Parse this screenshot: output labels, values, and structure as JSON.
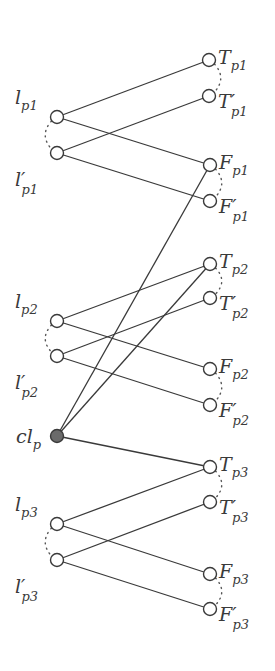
{
  "diagram": {
    "title": "",
    "node_radius": 6.5,
    "colors": {
      "line": "#3a3a3a",
      "node_fill": "#ffffff",
      "filled_node": "#6a6a6a"
    },
    "nodes": [
      {
        "id": "T_p1",
        "main": "T",
        "prime": false,
        "sub": "p1",
        "x": 209,
        "y": 60,
        "side": "right"
      },
      {
        "id": "T'_p1",
        "main": "T",
        "prime": true,
        "sub": "p1",
        "x": 209,
        "y": 96,
        "side": "right"
      },
      {
        "id": "l_p1",
        "main": "l",
        "prime": false,
        "sub": "p1",
        "x": 57,
        "y": 117,
        "side": "left"
      },
      {
        "id": "l'_p1",
        "main": "l",
        "prime": true,
        "sub": "p1",
        "x": 57,
        "y": 153,
        "side": "left"
      },
      {
        "id": "F_p1",
        "main": "F",
        "prime": false,
        "sub": "p1",
        "x": 210,
        "y": 165,
        "side": "right"
      },
      {
        "id": "F'_p1",
        "main": "F",
        "prime": true,
        "sub": "p1",
        "x": 210,
        "y": 201,
        "side": "right"
      },
      {
        "id": "T_p2",
        "main": "T",
        "prime": false,
        "sub": "p2",
        "x": 210,
        "y": 264,
        "side": "right"
      },
      {
        "id": "T'_p2",
        "main": "T",
        "prime": true,
        "sub": "p2",
        "x": 210,
        "y": 298,
        "side": "right"
      },
      {
        "id": "l_p2",
        "main": "l",
        "prime": false,
        "sub": "p2",
        "x": 57,
        "y": 321,
        "side": "left"
      },
      {
        "id": "l'_p2",
        "main": "l",
        "prime": true,
        "sub": "p2",
        "x": 57,
        "y": 356,
        "side": "left"
      },
      {
        "id": "F_p2",
        "main": "F",
        "prime": false,
        "sub": "p2",
        "x": 210,
        "y": 369,
        "side": "right"
      },
      {
        "id": "F'_p2",
        "main": "F",
        "prime": true,
        "sub": "p2",
        "x": 210,
        "y": 405,
        "side": "right"
      },
      {
        "id": "cl_p",
        "main": "cl",
        "prime": false,
        "sub": "p",
        "x": 57,
        "y": 436,
        "side": "left",
        "filled": true
      },
      {
        "id": "T_p3",
        "main": "T",
        "prime": false,
        "sub": "p3",
        "x": 210,
        "y": 467,
        "side": "right"
      },
      {
        "id": "T'_p3",
        "main": "T",
        "prime": true,
        "sub": "p3",
        "x": 210,
        "y": 502,
        "side": "right"
      },
      {
        "id": "l_p3",
        "main": "l",
        "prime": false,
        "sub": "p3",
        "x": 57,
        "y": 524,
        "side": "left"
      },
      {
        "id": "l'_p3",
        "main": "l",
        "prime": true,
        "sub": "p3",
        "x": 57,
        "y": 560,
        "side": "left"
      },
      {
        "id": "F_p3",
        "main": "F",
        "prime": false,
        "sub": "p3",
        "x": 210,
        "y": 574,
        "side": "right"
      },
      {
        "id": "F'_p3",
        "main": "F",
        "prime": true,
        "sub": "p3",
        "x": 210,
        "y": 609,
        "side": "right"
      }
    ],
    "edges": [
      [
        "l_p1",
        "T_p1"
      ],
      [
        "l_p1",
        "F_p1"
      ],
      [
        "l'_p1",
        "T'_p1"
      ],
      [
        "l'_p1",
        "F'_p1"
      ],
      [
        "l_p2",
        "T_p2"
      ],
      [
        "l_p2",
        "F_p2"
      ],
      [
        "l'_p2",
        "T'_p2"
      ],
      [
        "l'_p2",
        "F'_p2"
      ],
      [
        "l_p3",
        "T_p3"
      ],
      [
        "l_p3",
        "F_p3"
      ],
      [
        "l'_p3",
        "T'_p3"
      ],
      [
        "l'_p3",
        "F'_p3"
      ],
      [
        "cl_p",
        "F_p1"
      ],
      [
        "cl_p",
        "T_p2"
      ],
      [
        "cl_p",
        "T_p3"
      ]
    ],
    "dotted_pairs": [
      [
        "l_p1",
        "l'_p1"
      ],
      [
        "T_p1",
        "T'_p1"
      ],
      [
        "F_p1",
        "F'_p1"
      ],
      [
        "l_p2",
        "l'_p2"
      ],
      [
        "T_p2",
        "T'_p2"
      ],
      [
        "F_p2",
        "F'_p2"
      ],
      [
        "l_p3",
        "l'_p3"
      ],
      [
        "T_p3",
        "T'_p3"
      ],
      [
        "F_p3",
        "F'_p3"
      ]
    ]
  }
}
